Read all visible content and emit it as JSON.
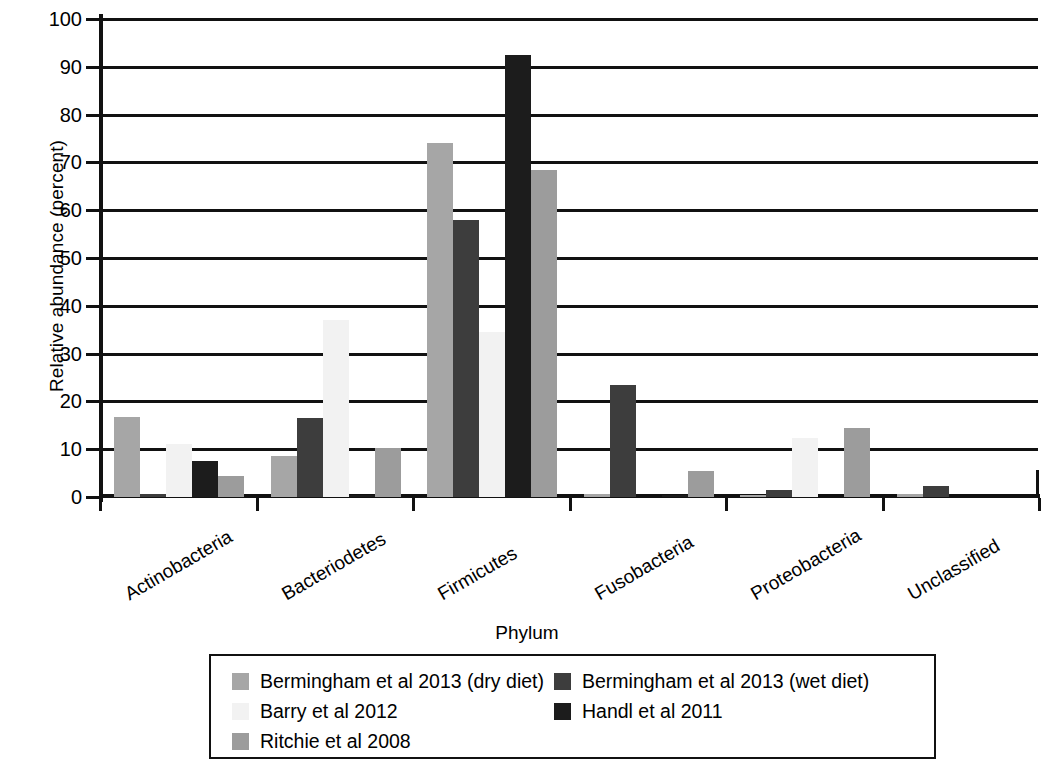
{
  "chart_data": {
    "type": "bar",
    "title": "",
    "xlabel": "Phylum",
    "ylabel": "Relative abundance (percent)",
    "ylim": [
      0,
      100
    ],
    "ytick_labels": [
      "0",
      "10",
      "20",
      "30",
      "40",
      "50",
      "60",
      "70",
      "80",
      "90",
      "100"
    ],
    "ytick_values": [
      0,
      10,
      20,
      30,
      40,
      50,
      60,
      70,
      80,
      90,
      100
    ],
    "grid": true,
    "legend_position": "bottom",
    "categories": [
      "Actinobacteria",
      "Bacteriodetes",
      "Firmicutes",
      "Fusobacteria",
      "Proteobacteria",
      "Unclassified"
    ],
    "series": [
      {
        "name": "Bermingham et al 2013 (dry diet)",
        "color": "#a6a6a6",
        "values": [
          16.7,
          8.6,
          74.0,
          0.6,
          0.5,
          0.6
        ]
      },
      {
        "name": "Bermingham et al 2013 (wet diet)",
        "color": "#3d3d3d",
        "values": [
          0.6,
          16.5,
          58.0,
          23.5,
          1.5,
          2.4
        ]
      },
      {
        "name": "Barry et al 2012",
        "color": "#f2f2f2",
        "values": [
          11.0,
          37.0,
          34.5,
          0.0,
          12.3,
          0.0
        ]
      },
      {
        "name": "Handl et al 2011",
        "color": "#1c1c1c",
        "values": [
          7.5,
          0.4,
          92.5,
          0.4,
          0.0,
          0.0
        ]
      },
      {
        "name": "Ritchie et al 2008",
        "color": "#9c9c9c",
        "values": [
          4.3,
          10.3,
          68.5,
          5.5,
          14.5,
          0.0
        ]
      }
    ]
  },
  "legend": {
    "entries": [
      "Bermingham et al 2013 (dry diet)",
      "Bermingham et al 2013 (wet diet)",
      "Barry et al 2012",
      "Handl et al 2011",
      "Ritchie et al 2008"
    ]
  }
}
